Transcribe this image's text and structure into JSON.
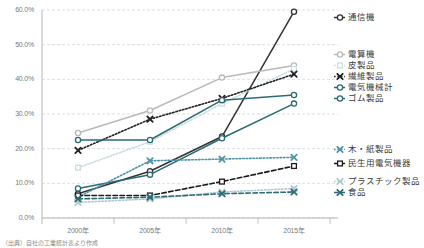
{
  "chart_data": {
    "type": "line",
    "title": "",
    "xlabel": "",
    "ylabel": "",
    "x": [
      "2000年",
      "2005年",
      "2010年",
      "2015年"
    ],
    "xtick_labels": [
      "2000年",
      "2005年",
      "2010年",
      "2015年"
    ],
    "ytick_labels": [
      "0.0%",
      "10.0%",
      "20.0%",
      "30.0%",
      "40.0%",
      "50.0%",
      "60.0%"
    ],
    "ylim": [
      0,
      60
    ],
    "yticks": [
      0,
      10,
      20,
      30,
      40,
      50,
      60
    ],
    "grid": true,
    "legend_position": "right",
    "series": [
      {
        "name": "通信機",
        "values": [
          7.0,
          13.5,
          23.5,
          59.5
        ],
        "color": "#333333",
        "style": "solid",
        "marker": "circle",
        "legend_group": "top"
      },
      {
        "name": "電算機",
        "values": [
          24.5,
          31.0,
          40.5,
          44.0
        ],
        "color": "#b9b9b9",
        "style": "solid",
        "marker": "circle",
        "legend_group": "middle"
      },
      {
        "name": "皮製品",
        "values": [
          14.5,
          22.0,
          33.0,
          43.0
        ],
        "color": "#c9dde2",
        "style": "dotted",
        "marker": "square",
        "legend_group": "middle"
      },
      {
        "name": "繊維製品",
        "values": [
          19.5,
          28.5,
          34.5,
          41.5
        ],
        "color": "#222222",
        "style": "dotted",
        "marker": "x",
        "legend_group": "middle"
      },
      {
        "name": "電気機械計",
        "values": [
          22.5,
          22.5,
          34.0,
          35.5
        ],
        "color": "#2b6b74",
        "style": "solid",
        "marker": "circle",
        "legend_group": "middle"
      },
      {
        "name": "ゴム製品",
        "values": [
          8.5,
          12.5,
          23.0,
          33.0
        ],
        "color": "#2b6b74",
        "style": "solid",
        "marker": "circle",
        "legend_group": "middle"
      },
      {
        "name": "木・紙製品",
        "values": [
          6.0,
          16.5,
          17.0,
          17.5
        ],
        "color": "#4e95a5",
        "style": "dotted",
        "marker": "x",
        "legend_group": "bottom"
      },
      {
        "name": "民生用電気機器",
        "values": [
          6.5,
          6.5,
          10.5,
          15.0
        ],
        "color": "#1a1a1a",
        "style": "dashed",
        "marker": "square",
        "legend_group": "bottom"
      },
      {
        "name": "プラスチック製品",
        "values": [
          4.5,
          5.5,
          7.5,
          8.5
        ],
        "color": "#b0c9ce",
        "style": "dotted",
        "marker": "x",
        "legend_group": "bottom"
      },
      {
        "name": "食品",
        "values": [
          5.5,
          6.0,
          7.0,
          7.5
        ],
        "color": "#2b6b74",
        "style": "dashed",
        "marker": "x",
        "legend_group": "bottom"
      }
    ]
  },
  "legend": {
    "items": [
      {
        "label": "通信機",
        "top": 12
      },
      {
        "label": "電算機",
        "top": 49
      },
      {
        "label": "皮製品",
        "top": 60
      },
      {
        "label": "繊維製品",
        "top": 71
      },
      {
        "label": "電気機械計",
        "top": 82
      },
      {
        "label": "ゴム製品",
        "top": 93
      },
      {
        "label": "木・紙製品",
        "top": 144
      },
      {
        "label": "民生用電気機器",
        "top": 158
      },
      {
        "label": "プラスチック製品",
        "top": 176
      },
      {
        "label": "食品",
        "top": 187
      }
    ]
  },
  "source": {
    "note": "（出典）自社の工業統計表より作成"
  },
  "colors": {
    "axis": "#b5b5b5",
    "grid": "#cfd8dc",
    "text": "#7a7a7a",
    "accent_teal": "#2b6b74",
    "accent_light": "#b9b9b9"
  }
}
